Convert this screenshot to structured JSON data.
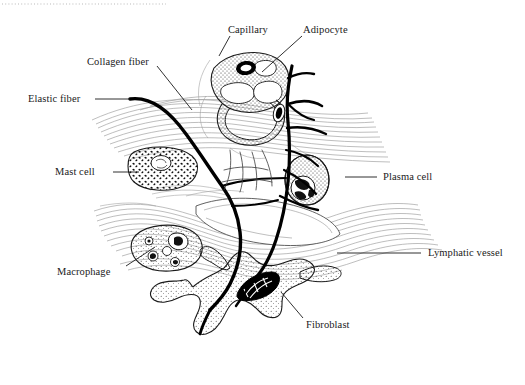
{
  "figure": {
    "type": "labeled-histology-diagram",
    "width": 525,
    "height": 385,
    "background_color": "#ffffff",
    "ink_color": "#1a1a1a",
    "fiber_color": "#8c8c8c"
  },
  "top_rule": {
    "name": "dotted-rule",
    "style": "dotted",
    "color": "#b9b9b9",
    "x1": 2,
    "x2": 166,
    "y": 4
  },
  "labels": [
    {
      "id": "collagen-fiber",
      "text": "Collagen fiber",
      "x": 87,
      "y": 56,
      "anchor": "start",
      "leader": {
        "type": "line",
        "x1": 157,
        "y1": 66,
        "x2": 192,
        "y2": 110
      }
    },
    {
      "id": "capillary",
      "text": "Capillary",
      "x": 228,
      "y": 24,
      "anchor": "start",
      "leader": {
        "type": "line",
        "x1": 230,
        "y1": 36,
        "x2": 219,
        "y2": 56
      }
    },
    {
      "id": "adipocyte",
      "text": "Adipocyte",
      "x": 303,
      "y": 24,
      "anchor": "start",
      "leader": {
        "type": "line",
        "x1": 302,
        "y1": 36,
        "x2": 262,
        "y2": 72
      }
    },
    {
      "id": "elastic-fiber",
      "text": "Elastic fiber",
      "x": 28,
      "y": 93,
      "anchor": "start",
      "leader": {
        "type": "line",
        "x1": 95,
        "y1": 99,
        "x2": 130,
        "y2": 99
      }
    },
    {
      "id": "mast-cell",
      "text": "Mast cell",
      "x": 55,
      "y": 166,
      "anchor": "start",
      "leader": {
        "type": "line",
        "x1": 113,
        "y1": 172,
        "x2": 139,
        "y2": 172
      }
    },
    {
      "id": "plasma-cell",
      "text": "Plasma cell",
      "x": 383,
      "y": 171,
      "anchor": "start",
      "leader": {
        "type": "line",
        "x1": 345,
        "y1": 177,
        "x2": 377,
        "y2": 177
      }
    },
    {
      "id": "macrophage",
      "text": "Macrophage",
      "x": 57,
      "y": 266,
      "anchor": "start",
      "leader": {
        "type": "line",
        "x1": 126,
        "y1": 266,
        "x2": 155,
        "y2": 247
      }
    },
    {
      "id": "lymphatic-vessel",
      "text": "Lymphatic vessel",
      "x": 428,
      "y": 247,
      "anchor": "start",
      "leader": {
        "type": "line",
        "x1": 337,
        "y1": 253,
        "x2": 421,
        "y2": 253
      }
    },
    {
      "id": "fibroblast",
      "text": "Fibroblast",
      "x": 306,
      "y": 319,
      "anchor": "start",
      "leader": {
        "type": "line",
        "x1": 303,
        "y1": 318,
        "x2": 281,
        "y2": 292
      }
    }
  ],
  "structures": [
    {
      "id": "capillary",
      "label": "Capillary",
      "kind": "vessel-cross-section",
      "center": [
        248,
        95
      ],
      "note": "cross-sectioned vessel with stippled endothelium and dark nucleus"
    },
    {
      "id": "adipocyte",
      "label": "Adipocyte",
      "kind": "fat-cell",
      "center": [
        252,
        122
      ],
      "note": "large clear lipid-filled cell with peripheral nucleus"
    },
    {
      "id": "mast-cell",
      "label": "Mast cell",
      "kind": "granulated-cell",
      "center": [
        165,
        172
      ],
      "note": "ovoid cell packed with dark granules, pale round nucleus"
    },
    {
      "id": "plasma-cell",
      "label": "Plasma cell",
      "kind": "oval-cell",
      "center": [
        307,
        180
      ],
      "note": "oval cell with eccentric cartwheel (clock-face) nucleus"
    },
    {
      "id": "macrophage",
      "label": "Macrophage",
      "kind": "phagocytic-cell",
      "center": [
        167,
        248
      ],
      "note": "stippled cell containing phagocytosed vacuoles and debris"
    },
    {
      "id": "fibroblast",
      "label": "Fibroblast",
      "kind": "stellate-cell",
      "center": [
        258,
        310
      ],
      "note": "large stellate stippled cell with dark elongated nucleus"
    },
    {
      "id": "collagen-fiber",
      "label": "Collagen fiber",
      "kind": "fiber-bundle",
      "note": "wavy gray banded bundles running across the field"
    },
    {
      "id": "elastic-fiber",
      "label": "Elastic fiber",
      "kind": "branching-fiber",
      "note": "thick black branching fibers crossing the whole field"
    },
    {
      "id": "lymphatic-vessel",
      "label": "Lymphatic vessel",
      "kind": "thin-walled-channel",
      "center": [
        245,
        230
      ],
      "note": "flattened thin-walled channel among collagen bundles"
    }
  ]
}
